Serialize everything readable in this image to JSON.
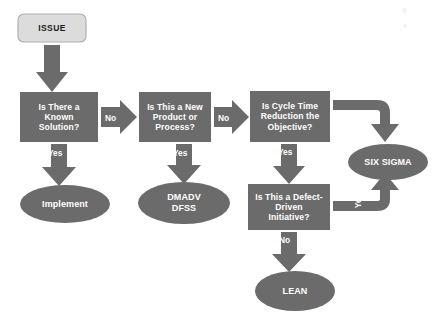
{
  "diagram": {
    "colors": {
      "shape_fill": "#6b6b6b",
      "start_fill": "#dcdcdc",
      "start_border": "#b4b4b4",
      "arrow_fill": "#6b6b6b",
      "text_on_shape": "#ffffff",
      "text_on_start": "#1c1c1c",
      "background": "#ffffff"
    },
    "nodes": [
      {
        "id": "issue",
        "type": "start",
        "label": "ISSUE"
      },
      {
        "id": "known_solution",
        "type": "decision",
        "label": "Is There a\nKnown\nSolution?",
        "lines": [
          "Is There a",
          "Known",
          "Solution?"
        ]
      },
      {
        "id": "new_product",
        "type": "decision",
        "label": "Is This a New\nProduct or\nProcess?",
        "lines": [
          "Is This a New",
          "Product or",
          "Process?"
        ]
      },
      {
        "id": "cycle_time",
        "type": "decision",
        "label": "Is Cycle Time\nReduction the\nObjective?",
        "lines": [
          "Is Cycle Time",
          "Reduction the",
          "Objective?"
        ]
      },
      {
        "id": "defect_driven",
        "type": "decision",
        "label": "Is This a Defect-\nDriven\nInitiative?",
        "lines": [
          "Is This a Defect-",
          "Driven",
          "Initiative?"
        ]
      },
      {
        "id": "implement",
        "type": "terminal",
        "label": "Implement",
        "lines": [
          "Implement"
        ]
      },
      {
        "id": "dmadv_dfss",
        "type": "terminal",
        "label": "DMADV\nDFSS",
        "lines": [
          "DMADV",
          "DFSS"
        ]
      },
      {
        "id": "six_sigma",
        "type": "terminal",
        "label": "SIX SIGMA",
        "lines": [
          "SIX SIGMA"
        ]
      },
      {
        "id": "lean",
        "type": "terminal",
        "label": "LEAN",
        "lines": [
          "LEAN"
        ]
      }
    ],
    "edges": [
      {
        "id": "issue-to-known",
        "from": "issue",
        "to": "known_solution",
        "label": "",
        "direction": "down"
      },
      {
        "id": "known-no",
        "from": "known_solution",
        "to": "new_product",
        "label": "No",
        "direction": "right"
      },
      {
        "id": "known-yes",
        "from": "known_solution",
        "to": "implement",
        "label": "Yes",
        "direction": "down"
      },
      {
        "id": "new-no",
        "from": "new_product",
        "to": "cycle_time",
        "label": "No",
        "direction": "right"
      },
      {
        "id": "new-yes",
        "from": "new_product",
        "to": "dmadv_dfss",
        "label": "Yes",
        "direction": "down"
      },
      {
        "id": "cycle-no",
        "from": "cycle_time",
        "to": "six_sigma",
        "label": "No",
        "direction": "elbow-right-down"
      },
      {
        "id": "cycle-yes",
        "from": "cycle_time",
        "to": "defect_driven",
        "label": "Yes",
        "direction": "down"
      },
      {
        "id": "defect-yes",
        "from": "defect_driven",
        "to": "six_sigma",
        "label": "Yes",
        "direction": "elbow-right-up"
      },
      {
        "id": "defect-no",
        "from": "defect_driven",
        "to": "lean",
        "label": "No",
        "direction": "down"
      }
    ]
  }
}
